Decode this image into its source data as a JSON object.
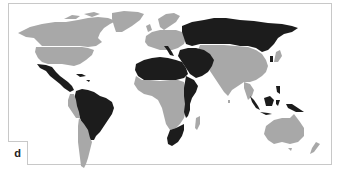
{
  "figure": {
    "panel_label": "d",
    "type": "choropleth world map",
    "categories": [
      {
        "name": "category-dark",
        "color": "#1c1c1c"
      },
      {
        "name": "category-gray",
        "color": "#a8a8a8"
      }
    ],
    "background_color": "#ffffff",
    "frame_color": "#c8c8c8"
  },
  "regions": {
    "dark": [
      "Russia",
      "Mexico",
      "Central America (part)",
      "Colombia",
      "Venezuela",
      "Brazil",
      "Paraguay",
      "North Africa (Algeria, Libya, Egypt, Niger, Chad, Sudan)",
      "Middle East (Saudi Arabia, Iran, Iraq, Turkey)",
      "East Africa coast (Somalia, Kenya, Tanzania, Mozambique)",
      "South Africa",
      "Italy",
      "Indonesia",
      "Philippines",
      "Papua New Guinea",
      "Japan (partial)"
    ],
    "gray": [
      "Canada",
      "United States",
      "Alaska",
      "Greenland",
      "Western Europe",
      "Scandinavia",
      "Central & West Africa",
      "Madagascar",
      "China",
      "Mongolia",
      "India",
      "Kazakhstan",
      "Southeast Asia mainland",
      "Peru",
      "Chile",
      "Argentina",
      "Bolivia",
      "Australia",
      "New Zealand"
    ]
  }
}
